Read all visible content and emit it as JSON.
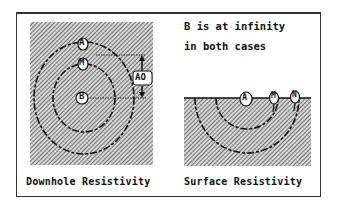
{
  "diagram": {
    "left_panel": {
      "caption": "Downhole Resistivity",
      "electrodes": [
        {
          "label": "A",
          "position": "outer"
        },
        {
          "label": "M",
          "position": "inner"
        },
        {
          "label": "B",
          "position": "center"
        }
      ],
      "dimension_label": "AO"
    },
    "right_panel": {
      "caption": "Surface Resistivity",
      "note_line1": "B is at infinity",
      "note_line2": "in both cases",
      "electrodes": [
        {
          "label": "A"
        },
        {
          "label": "M"
        },
        {
          "label": "N"
        }
      ]
    },
    "colors": {
      "ink": "#111111",
      "hatch": "#555555",
      "background": "#ffffff"
    }
  }
}
